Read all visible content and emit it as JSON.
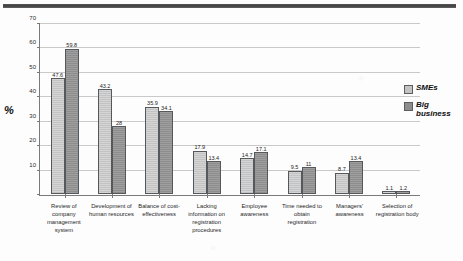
{
  "chart_data": {
    "type": "bar",
    "title": "",
    "xlabel": "",
    "ylabel": "%",
    "ylim": [
      0,
      70
    ],
    "yticks": [
      0,
      10,
      20,
      30,
      40,
      50,
      60,
      70
    ],
    "ytick_labels": [
      "",
      "10",
      "20",
      "30",
      "40",
      "50",
      "60",
      "70"
    ],
    "grid": true,
    "legend_position": "right",
    "categories": [
      "Review of company management system",
      "Development of human resources",
      "Balance of cost-effectiveness",
      "Lacking information on registration procedures",
      "Employee awareness",
      "Time needed to obtain registration",
      "Managers' awareness",
      "Selection of registration body"
    ],
    "series": [
      {
        "name": "SMEs",
        "color": "#c3c3c3",
        "values": [
          47.6,
          43.2,
          35.9,
          17.9,
          14.7,
          9.5,
          8.7,
          1.1
        ],
        "labels": [
          "47.6",
          "43.2",
          "35.9",
          "17.9",
          "14.7",
          "9.5",
          "8.7",
          "1.1"
        ]
      },
      {
        "name": "Big business",
        "color": "#8d8d8d",
        "values": [
          59.8,
          28.0,
          34.1,
          13.4,
          17.1,
          11.0,
          13.4,
          1.2
        ],
        "labels": [
          "59.8",
          "28",
          "34.1",
          "13.4",
          "17.1",
          "11",
          "13.4",
          "1.2"
        ]
      }
    ]
  },
  "legend": {
    "items": [
      {
        "label": "SMEs"
      },
      {
        "label": "Big business"
      }
    ]
  },
  "axis": {
    "y_title": "%"
  }
}
